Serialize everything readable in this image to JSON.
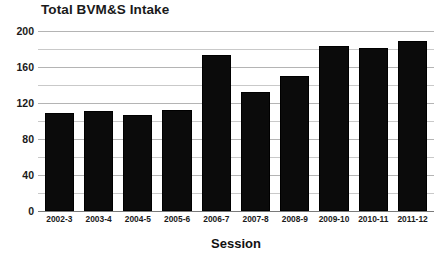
{
  "chart_data": {
    "type": "bar",
    "title": "Total BVM&S Intake",
    "xlabel": "Session",
    "ylabel": "",
    "categories": [
      "2002-3",
      "2003-4",
      "2004-5",
      "2005-6",
      "2006-7",
      "2007-8",
      "2008-9",
      "2009-10",
      "2010-11",
      "2011-12"
    ],
    "values": [
      109,
      111,
      107,
      112,
      173,
      132,
      150,
      183,
      181,
      189
    ],
    "series": [
      {
        "name": "Total BVM&S Intake",
        "values": [
          109,
          111,
          107,
          112,
          173,
          132,
          150,
          183,
          181,
          189
        ]
      }
    ],
    "ylim": [
      0,
      200
    ],
    "y_major_ticks": [
      0,
      40,
      80,
      120,
      160,
      200
    ],
    "y_gridline_values": [
      0,
      20,
      40,
      60,
      80,
      100,
      120,
      140,
      160,
      180,
      200
    ],
    "y_tick_labels": [
      "0",
      "40",
      "80",
      "120",
      "160",
      "200"
    ],
    "grid": true,
    "legend": false,
    "legend_position": "none",
    "bar_color": "#0b0b0b",
    "gridline_color": "#c9c9c9",
    "background_color": "#ffffff",
    "text_color": "#1a1a1a"
  }
}
